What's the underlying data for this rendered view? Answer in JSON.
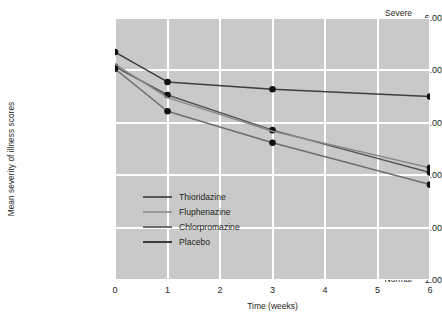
{
  "chart_data": {
    "type": "line",
    "title": "",
    "xlabel": "Time (weeks)",
    "ylabel": "Mean severity of illness scores",
    "x": [
      0,
      1,
      3,
      6
    ],
    "xlim": [
      0,
      6
    ],
    "ylim": [
      1,
      6
    ],
    "grid": true,
    "legend_position": "inside-lower-left",
    "xticks": [
      "0",
      "1",
      "2",
      "3",
      "4",
      "5",
      "6"
    ],
    "xtick_values": [
      0,
      1,
      2,
      3,
      4,
      5,
      6
    ],
    "ytick_values": [
      1,
      2,
      3,
      4,
      5,
      6
    ],
    "yticks": [
      {
        "value": 6,
        "number": "6.00",
        "word": "Severe\nillness"
      },
      {
        "value": 5,
        "number": "5.00",
        "word": "Marked\nillness"
      },
      {
        "value": 4,
        "number": "4.00",
        "word": "Moderate\nillness"
      },
      {
        "value": 3,
        "number": "3.00",
        "word": "Mild\nillness"
      },
      {
        "value": 2,
        "number": "2.00",
        "word": "Borderline"
      },
      {
        "value": 1,
        "number": "1.00",
        "word": "Normal"
      }
    ],
    "series": [
      {
        "name": "Thioridazine",
        "color": "#565656",
        "values": [
          5.07,
          4.53,
          3.86,
          3.05
        ],
        "markers": [
          true,
          true,
          true,
          true
        ]
      },
      {
        "name": "Fluphenazine",
        "color": "#8a8a8a",
        "values": [
          5.12,
          4.48,
          3.84,
          3.14
        ],
        "markers": [
          false,
          false,
          false,
          true
        ]
      },
      {
        "name": "Chlorpromazine",
        "color": "#6e6e6e",
        "values": [
          5.03,
          4.22,
          3.62,
          2.82
        ],
        "markers": [
          true,
          true,
          true,
          true
        ]
      },
      {
        "name": "Placebo",
        "color": "#3d3d3d",
        "values": [
          5.35,
          4.78,
          4.64,
          4.5
        ],
        "markers": [
          true,
          true,
          true,
          true
        ]
      }
    ]
  },
  "legend": {
    "items": [
      {
        "label": "Thioridazine",
        "color": "#565656"
      },
      {
        "label": "Fluphenazine",
        "color": "#9a9a9a"
      },
      {
        "label": "Chlorpromazine",
        "color": "#6e6e6e"
      },
      {
        "label": "Placebo",
        "color": "#3d3d3d"
      }
    ]
  }
}
